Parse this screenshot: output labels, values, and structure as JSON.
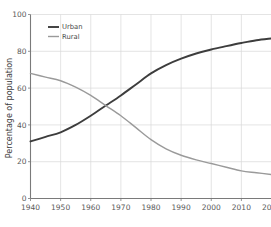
{
  "chart_data": {
    "type": "line",
    "title": "",
    "subtitle": "",
    "xlabel": "",
    "ylabel": "Percentage of population",
    "xlim": [
      1940,
      2020
    ],
    "ylim": [
      0,
      100
    ],
    "grid": true,
    "legend_position": "top-left inside plot",
    "x_ticks": [
      "1940",
      "1950",
      "1960",
      "1970",
      "1980",
      "1990",
      "2000",
      "2010",
      "2020"
    ],
    "x_tick_values": [
      1940,
      1950,
      1960,
      1970,
      1980,
      1990,
      2000,
      2010,
      2020
    ],
    "y_ticks": [
      "0",
      "20",
      "40",
      "60",
      "80",
      "100"
    ],
    "y_tick_values": [
      0,
      20,
      40,
      60,
      80,
      100
    ],
    "x": [
      1940,
      1945,
      1950,
      1955,
      1960,
      1965,
      1970,
      1975,
      1980,
      1985,
      1990,
      1995,
      2000,
      2005,
      2010,
      2015,
      2020
    ],
    "series": [
      {
        "name": "Urban",
        "color": "#3d3d3d",
        "width": 1.9,
        "values": [
          31,
          33.5,
          36,
          40,
          45,
          50.5,
          56,
          62,
          68,
          72.5,
          76,
          78.8,
          81,
          82.8,
          84.5,
          86,
          87
        ]
      },
      {
        "name": "Rural",
        "color": "#9a9a9a",
        "width": 1.4,
        "values": [
          68,
          66,
          64,
          60.5,
          56,
          50.5,
          45,
          38.5,
          32,
          27,
          23.5,
          21,
          19,
          17,
          15,
          14,
          13
        ]
      }
    ],
    "annotations": []
  },
  "legend": {
    "entries": [
      {
        "label": "Urban"
      },
      {
        "label": "Rural"
      }
    ]
  },
  "axes": {
    "y_axis_title": "Percentage of population"
  },
  "colors": {
    "grid": "#d8d8d8",
    "axis": "#7a7a7a",
    "tick_text": "#5a5a5a",
    "urban": "#3d3d3d",
    "rural": "#9a9a9a",
    "background": "#ffffff"
  }
}
